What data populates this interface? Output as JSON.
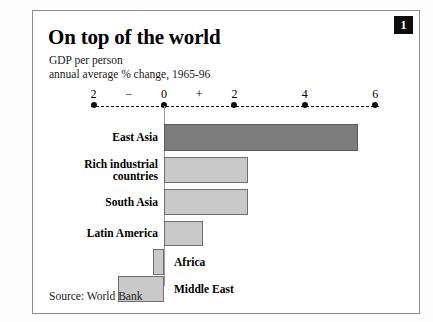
{
  "figure": {
    "badge_number": "1",
    "source_note": "Source: World Bank"
  },
  "colors": {
    "highlight_bar": "#7c7c7c",
    "bar": "#c9c9c9",
    "bar_border": "#6f6f6f",
    "axis": "#111111",
    "panel_border": "#8c8c8c",
    "badge_background": "#0d0d0d",
    "badge_text": "#ffffff"
  },
  "chart_data": {
    "type": "bar",
    "orientation": "horizontal",
    "title": "On top of the world",
    "subtitle_line1": "GDP per person",
    "subtitle_line2": "annual average % change, 1965-96",
    "xlabel": "",
    "ylabel": "",
    "xlim": [
      -2,
      6
    ],
    "xticks": [
      -2,
      0,
      2,
      4,
      6
    ],
    "xtick_labels": [
      "2",
      "0",
      "2",
      "4",
      "6"
    ],
    "sign_markers": [
      {
        "label": "−",
        "value": -1
      },
      {
        "label": "+",
        "value": 1
      }
    ],
    "grid": false,
    "legend": "none",
    "categories": [
      "East Asia",
      "Rich industrial countries",
      "South Asia",
      "Latin America",
      "Africa",
      "Middle East"
    ],
    "category_label_lines": [
      [
        "East Asia"
      ],
      [
        "Rich industrial",
        "countries"
      ],
      [
        "South Asia"
      ],
      [
        "Latin America"
      ],
      [
        "Africa"
      ],
      [
        "Middle East"
      ]
    ],
    "values": [
      5.5,
      2.4,
      2.4,
      1.1,
      -0.3,
      -1.3
    ],
    "highlight_index": 0
  },
  "bars": [
    {
      "name": "east-asia",
      "label_lines": [
        "East Asia"
      ],
      "value": 5.5,
      "top": 113,
      "height": 27,
      "label_side": "right",
      "highlight": true
    },
    {
      "name": "rich-industrial-countries",
      "label_lines": [
        "Rich industrial",
        "countries"
      ],
      "value": 2.4,
      "top": 146,
      "height": 26,
      "label_side": "right",
      "highlight": false
    },
    {
      "name": "south-asia",
      "label_lines": [
        "South Asia"
      ],
      "value": 2.4,
      "top": 178,
      "height": 26,
      "label_side": "right",
      "highlight": false
    },
    {
      "name": "latin-america",
      "label_lines": [
        "Latin America"
      ],
      "value": 1.1,
      "top": 210,
      "height": 25,
      "label_side": "right",
      "highlight": false
    },
    {
      "name": "africa",
      "label_lines": [
        "Africa"
      ],
      "value": -0.3,
      "top": 238,
      "height": 26,
      "label_side": "left",
      "highlight": false
    },
    {
      "name": "middle-east",
      "label_lines": [
        "Middle East"
      ],
      "value": -1.3,
      "top": 265,
      "height": 26,
      "label_side": "left",
      "highlight": false
    }
  ]
}
